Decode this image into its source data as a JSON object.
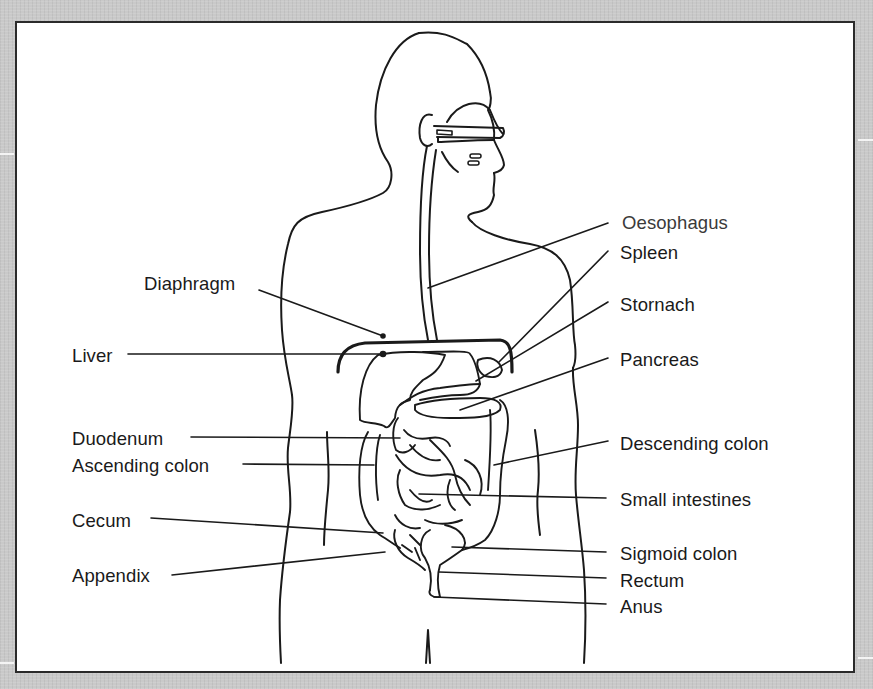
{
  "diagram": {
    "type": "anatomical-labeled-diagram",
    "colors": {
      "background": "#c9c9c9",
      "panel": "#ffffff",
      "frame_border": "#2b2b2b",
      "lines": "#1a1a1a"
    },
    "labels_left": [
      {
        "id": "diaphragm",
        "text": "Diaphragm"
      },
      {
        "id": "liver",
        "text": "Liver"
      },
      {
        "id": "duodenum",
        "text": "Duodenum"
      },
      {
        "id": "ascending-colon",
        "text": "Ascending colon"
      },
      {
        "id": "cecum",
        "text": "Cecum"
      },
      {
        "id": "appendix",
        "text": "Appendix"
      }
    ],
    "labels_right": [
      {
        "id": "oesophagus",
        "text": "Oesophagus"
      },
      {
        "id": "spleen",
        "text": "Spleen"
      },
      {
        "id": "stomach",
        "text": "Stornach"
      },
      {
        "id": "pancreas",
        "text": "Pancreas"
      },
      {
        "id": "descending-colon",
        "text": "Descending colon"
      },
      {
        "id": "small-intestines",
        "text": "Small intestines"
      },
      {
        "id": "sigmoid-colon",
        "text": "Sigmoid colon"
      },
      {
        "id": "rectum",
        "text": "Rectum"
      },
      {
        "id": "anus",
        "text": "Anus"
      }
    ]
  }
}
